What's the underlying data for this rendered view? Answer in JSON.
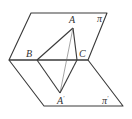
{
  "diagram": {
    "type": "dihedral-angle-figure",
    "stroke_color": "#3a3a3a",
    "planes": [
      {
        "name": "pi",
        "label": "π",
        "points": [
          [
            31,
            13
          ],
          [
            107,
            13
          ],
          [
            88,
            60
          ],
          [
            9,
            60
          ]
        ]
      },
      {
        "name": "pi_prime",
        "label": "π",
        "label_prime": "′",
        "points": [
          [
            9,
            60
          ],
          [
            88,
            60
          ],
          [
            123,
            106
          ],
          [
            44,
            106
          ]
        ]
      }
    ],
    "points": {
      "A": {
        "label": "A",
        "x": 73,
        "y": 28
      },
      "B": {
        "label": "B",
        "x": 37,
        "y": 60
      },
      "C": {
        "label": "C",
        "x": 77,
        "y": 60
      },
      "A_prime": {
        "label": "A",
        "prime": "′",
        "x": 60,
        "y": 93
      }
    },
    "segments": [
      {
        "from": "A",
        "to": "B",
        "style": "solid"
      },
      {
        "from": "A",
        "to": "C",
        "style": "solid"
      },
      {
        "from": "A",
        "to": "A_prime",
        "style": "thin"
      },
      {
        "from": "B",
        "to": "A_prime",
        "style": "solid"
      },
      {
        "from": "C",
        "to": "A_prime",
        "style": "solid"
      }
    ],
    "labels": {
      "A": "A",
      "B": "B",
      "C": "C",
      "A_prime": "A",
      "A_prime_mark": "′",
      "pi": "π",
      "pi_prime": "π",
      "pi_prime_mark": "′"
    }
  }
}
